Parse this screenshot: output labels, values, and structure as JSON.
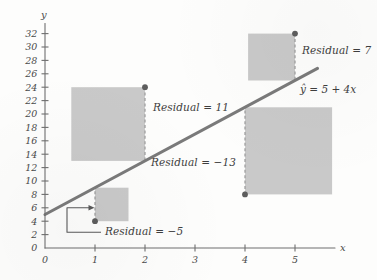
{
  "chart_data": {
    "type": "scatter",
    "title": "",
    "subtitle": "",
    "xlabel": "x",
    "ylabel": "y",
    "grid": false,
    "legend": "none",
    "xlim": [
      0,
      5.8
    ],
    "ylim": [
      0,
      33.5
    ],
    "xticks": [
      0,
      1,
      2,
      3,
      4,
      5
    ],
    "xticklabels": [
      "0",
      "1",
      "2",
      "3",
      "4",
      "5"
    ],
    "yticks": [
      0,
      2,
      4,
      6,
      8,
      10,
      12,
      14,
      16,
      18,
      20,
      22,
      24,
      26,
      28,
      30,
      32
    ],
    "yticklabels": [
      "0",
      "2",
      "4",
      "6",
      "8",
      "10",
      "12",
      "14",
      "16",
      "18",
      "20",
      "22",
      "24",
      "26",
      "28",
      "30",
      "32"
    ],
    "x": [
      1,
      2,
      4,
      5
    ],
    "y": [
      4,
      24,
      8,
      32
    ],
    "points": [
      {
        "x": 1,
        "y": 4,
        "predicted": 9,
        "residual": -5,
        "square_side": 5,
        "square_direction": "right"
      },
      {
        "x": 2,
        "y": 24,
        "predicted": 13,
        "residual": 11,
        "square_side": 11,
        "square_direction": "left"
      },
      {
        "x": 4,
        "y": 8,
        "predicted": 21,
        "residual": -13,
        "square_side": 13,
        "square_direction": "right"
      },
      {
        "x": 5,
        "y": 32,
        "predicted": 25,
        "residual": 7,
        "square_side": 7,
        "square_direction": "left"
      }
    ],
    "fit_line": {
      "equation": "ŷ = 5 + 4x",
      "intercept": 5,
      "slope": 4,
      "x_start": 0,
      "x_end": 5.45
    },
    "annotations": [
      {
        "id": "residual-neg5",
        "text": "Residual = −5",
        "x": 1,
        "y": 4,
        "value": -5
      },
      {
        "id": "residual-11",
        "text": "Residual = 11",
        "x": 2,
        "y": 24,
        "value": 11
      },
      {
        "id": "residual-neg13",
        "text": "Residual = −13",
        "x": 4,
        "y": 8,
        "value": -13
      },
      {
        "id": "residual-7",
        "text": "Residual = 7",
        "x": 5,
        "y": 32,
        "value": 7
      }
    ],
    "colors": {
      "square_fill": "#c4c4c4",
      "fit_line": "#7a7a7a",
      "point": "#5d5d5d",
      "axis": "#6f6f6f",
      "text": "#3e3e3e",
      "background": "#fdfdfc"
    }
  },
  "labels": {
    "axis_x": "x",
    "axis_y": "y",
    "equation": "ŷ = 5 + 4x",
    "residual_1": "Residual = −5",
    "residual_2": "Residual = 11",
    "residual_3": "Residual = −13",
    "residual_4": "Residual = 7",
    "tick_y_32": "32",
    "tick_y_30": "30",
    "tick_y_28": "28",
    "tick_y_26": "26",
    "tick_y_24": "24",
    "tick_y_22": "22",
    "tick_y_20": "20",
    "tick_y_18": "18",
    "tick_y_16": "16",
    "tick_y_14": "14",
    "tick_y_12": "12",
    "tick_y_10": "10",
    "tick_y_8": "8",
    "tick_y_6": "6",
    "tick_y_4": "4",
    "tick_y_2": "2",
    "tick_y_0": "0",
    "tick_x_0": "0",
    "tick_x_1": "1",
    "tick_x_2": "2",
    "tick_x_3": "3",
    "tick_x_4": "4",
    "tick_x_5": "5"
  }
}
